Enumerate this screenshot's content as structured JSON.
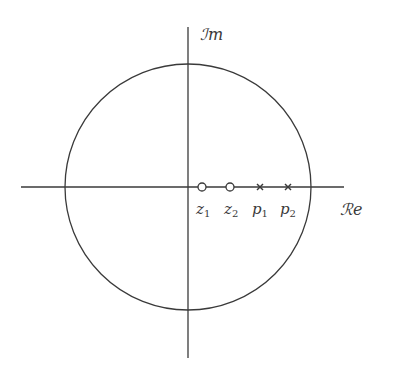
{
  "diagram": {
    "type": "pole-zero-plot",
    "axes": {
      "real_label": "ℛe",
      "imag_label": "ℐm",
      "real_label_text": "Re",
      "imag_label_text": "Im"
    },
    "unit_circle": true,
    "zeros": [
      {
        "label": "z",
        "sub": "1"
      },
      {
        "label": "z",
        "sub": "2"
      }
    ],
    "poles": [
      {
        "label": "p",
        "sub": "1"
      },
      {
        "label": "p",
        "sub": "2"
      }
    ],
    "colors": {
      "line": "#3a3a3a",
      "background": "#ffffff"
    }
  }
}
